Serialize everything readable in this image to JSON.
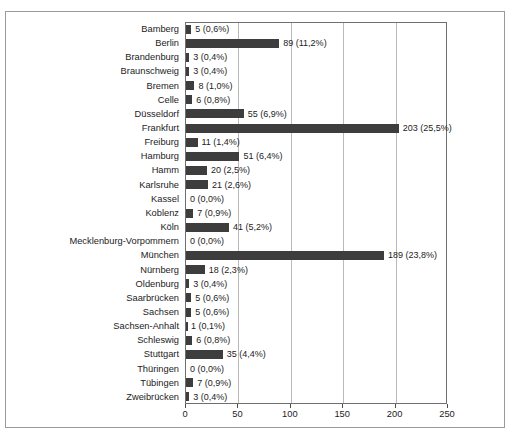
{
  "chart_data": {
    "type": "bar",
    "orientation": "horizontal",
    "title": "",
    "subtitle": "",
    "xlabel": "",
    "ylabel": "",
    "xlim": [
      0,
      250
    ],
    "xticks": [
      0,
      50,
      100,
      150,
      200,
      250
    ],
    "gridlines": [
      50,
      100,
      150,
      200
    ],
    "grid": true,
    "legend": null,
    "bar_color": "#3d3d3d",
    "decimal_separator": ",",
    "categories": [
      "Bamberg",
      "Berlin",
      "Brandenburg",
      "Braunschweig",
      "Bremen",
      "Celle",
      "Düsseldorf",
      "Frankfurt",
      "Freiburg",
      "Hamburg",
      "Hamm",
      "Karlsruhe",
      "Kassel",
      "Koblenz",
      "Köln",
      "Mecklenburg-Vorpommern",
      "München",
      "Nürnberg",
      "Oldenburg",
      "Saarbrücken",
      "Sachsen",
      "Sachsen-Anhalt",
      "Schleswig",
      "Stuttgart",
      "Thüringen",
      "Tübingen",
      "Zweibrücken"
    ],
    "values": [
      5,
      89,
      3,
      3,
      8,
      6,
      55,
      203,
      11,
      51,
      20,
      21,
      0,
      7,
      41,
      0,
      189,
      18,
      3,
      5,
      5,
      1,
      6,
      35,
      0,
      7,
      3
    ],
    "percents": [
      0.6,
      11.2,
      0.4,
      0.4,
      1.0,
      0.8,
      6.9,
      25.5,
      1.4,
      6.4,
      2.5,
      2.6,
      0.0,
      0.9,
      5.2,
      0.0,
      23.8,
      2.3,
      0.4,
      0.6,
      0.6,
      0.1,
      0.8,
      4.4,
      0.0,
      0.9,
      0.4
    ],
    "data_labels": [
      "5 (0,6%)",
      "89 (11,2%)",
      "3 (0,4%)",
      "3 (0,4%)",
      "8 (1,0%)",
      "6 (0,8%)",
      "55 (6,9%)",
      "203 (25,5%)",
      "11 (1,4%)",
      "51 (6,4%)",
      "20 (2,5%)",
      "21 (2,6%)",
      "0 (0,0%)",
      "7 (0,9%)",
      "41 (5,2%)",
      "0 (0,0%)",
      "189 (23,8%)",
      "18 (2,3%)",
      "3 (0,4%)",
      "5 (0,6%)",
      "5 (0,6%)",
      "1 (0,1%)",
      "6 (0,8%)",
      "35 (4,4%)",
      "0 (0,0%)",
      "7 (0,9%)",
      "3 (0,4%)"
    ],
    "xtick_labels": [
      "0",
      "50",
      "100",
      "150",
      "200",
      "250"
    ]
  }
}
